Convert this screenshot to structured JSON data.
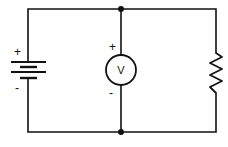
{
  "diagram": {
    "type": "circuit",
    "components": {
      "battery": {
        "label_positive": "+",
        "label_negative": "-"
      },
      "voltmeter": {
        "symbol": "V",
        "label_positive": "+",
        "label_negative": "-"
      },
      "resistor": {
        "label": ""
      }
    },
    "colors": {
      "wire": "#111111",
      "background": "#ffffff"
    }
  }
}
